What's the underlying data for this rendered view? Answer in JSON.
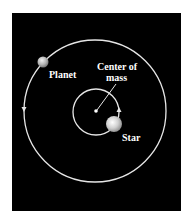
{
  "diagram": {
    "labels": {
      "planet": "Planet",
      "center_of_mass_line1": "Center of",
      "center_of_mass_line2": "mass",
      "star": "Star"
    },
    "colors": {
      "background": "#000000",
      "orbit": "#e6e6e6",
      "planet": "#b8b8b8",
      "star": "#d9d9d9",
      "text": "#ffffff"
    }
  }
}
